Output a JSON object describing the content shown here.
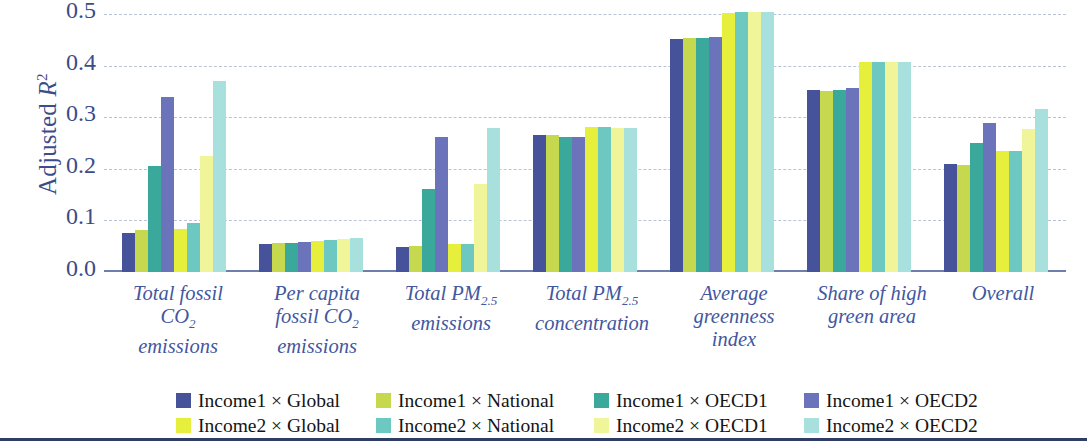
{
  "chart_data": {
    "type": "bar",
    "title": "",
    "xlabel": "",
    "ylabel": "Adjusted R²",
    "ylabel_main": "Adjusted ",
    "ylabel_italic": "R",
    "ylabel_sup": "2",
    "ylim": [
      0.0,
      0.5
    ],
    "yticks": [
      "0.0",
      "0.1",
      "0.2",
      "0.3",
      "0.4",
      "0.5"
    ],
    "ytick_values": [
      0.0,
      0.1,
      0.2,
      0.3,
      0.4,
      0.5
    ],
    "grid": true,
    "legend_position": "bottom",
    "categories": [
      "Total fossil CO₂ emissions",
      "Per capita fossil CO₂ emissions",
      "Total PM2.5 emissions",
      "Total PM2.5 concentration",
      "Average greenness index",
      "Share of high green area",
      "Overall"
    ],
    "category_lines": [
      [
        "Total fossil",
        "CO|2",
        "emissions"
      ],
      [
        "Per capita",
        "fossil CO|2",
        "emissions"
      ],
      [
        "Total PM|2.5",
        "emissions"
      ],
      [
        "Total PM|2.5",
        "concentration"
      ],
      [
        "Average",
        "greenness",
        "index"
      ],
      [
        "Share of high",
        "green area"
      ],
      [
        "Overall"
      ]
    ],
    "series": [
      {
        "name": "Income1 × Global",
        "color": "#46529a",
        "values": [
          0.075,
          0.055,
          0.048,
          0.266,
          0.452,
          0.352,
          0.21
        ]
      },
      {
        "name": "Income1 × National",
        "color": "#c6d94e",
        "values": [
          0.082,
          0.057,
          0.05,
          0.265,
          0.453,
          0.35,
          0.208
        ]
      },
      {
        "name": "Income1 × OECD1",
        "color": "#3aa89a",
        "values": [
          0.205,
          0.057,
          0.16,
          0.262,
          0.454,
          0.353,
          0.25
        ]
      },
      {
        "name": "Income1 × OECD2",
        "color": "#6b74bb",
        "values": [
          0.34,
          0.058,
          0.262,
          0.261,
          0.456,
          0.356,
          0.288
        ]
      },
      {
        "name": "Income2 × Global",
        "color": "#e6ef3c",
        "values": [
          0.083,
          0.061,
          0.055,
          0.281,
          0.502,
          0.407,
          0.235
        ]
      },
      {
        "name": "Income2 × National",
        "color": "#6cc8c0",
        "values": [
          0.095,
          0.062,
          0.055,
          0.281,
          0.503,
          0.407,
          0.235
        ]
      },
      {
        "name": "Income2 × OECD1",
        "color": "#f1f59a",
        "values": [
          0.225,
          0.064,
          0.17,
          0.28,
          0.503,
          0.407,
          0.278
        ]
      },
      {
        "name": "Income2 × OECD2",
        "color": "#a7e0dc",
        "values": [
          0.37,
          0.065,
          0.28,
          0.279,
          0.503,
          0.407,
          0.315
        ]
      }
    ]
  },
  "legend": {
    "row1": [
      {
        "label": "Income1 × Global",
        "color": "#46529a"
      },
      {
        "label": "Income1 × National",
        "color": "#c6d94e"
      },
      {
        "label": "Income1 × OECD1",
        "color": "#3aa89a"
      },
      {
        "label": "Income1 × OECD2",
        "color": "#6b74bb"
      }
    ],
    "row2": [
      {
        "label": "Income2 × Global",
        "color": "#e6ef3c"
      },
      {
        "label": "Income2 × National",
        "color": "#6cc8c0"
      },
      {
        "label": "Income2 × OECD1",
        "color": "#f1f59a"
      },
      {
        "label": "Income2 × OECD2",
        "color": "#a7e0dc"
      }
    ]
  },
  "colors": {
    "axis": "#6e7fae",
    "grid": "#b9c4d8",
    "tick_text": "#3b4c89",
    "category_text": "#4257a0",
    "legend_text": "#141414",
    "bottom_rule": "#2f3c63",
    "background": "#ffffff"
  }
}
